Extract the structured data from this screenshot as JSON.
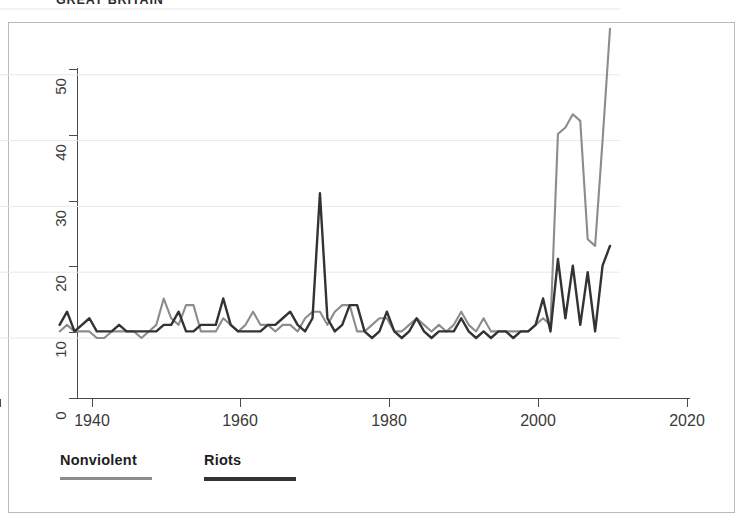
{
  "title": "GREAT BRITAIN",
  "legend": {
    "items": [
      {
        "label": "Nonviolent",
        "color": "#8c8c8c",
        "name": "legend-nonviolent"
      },
      {
        "label": "Riots",
        "color": "#333333",
        "name": "legend-riots"
      }
    ]
  },
  "axes": {
    "y_ticks": [
      "0",
      "10",
      "20",
      "30",
      "40",
      "50"
    ],
    "x_ticks": [
      "1940",
      "1960",
      "1980",
      "2000",
      "2020"
    ]
  },
  "chart_data": {
    "type": "line",
    "title": "GREAT BRITAIN",
    "xlabel": "",
    "ylabel": "",
    "xlim": [
      1940,
      2022
    ],
    "ylim": [
      0,
      52
    ],
    "grid": true,
    "grid_axis": "y",
    "legend_position": "below-axes",
    "x": [
      1946,
      1947,
      1948,
      1949,
      1950,
      1951,
      1952,
      1953,
      1954,
      1955,
      1956,
      1957,
      1958,
      1959,
      1960,
      1961,
      1962,
      1963,
      1964,
      1965,
      1966,
      1967,
      1968,
      1969,
      1970,
      1971,
      1972,
      1973,
      1974,
      1975,
      1976,
      1977,
      1978,
      1979,
      1980,
      1981,
      1982,
      1983,
      1984,
      1985,
      1986,
      1987,
      1988,
      1989,
      1990,
      1991,
      1992,
      1993,
      1994,
      1995,
      1996,
      1997,
      1998,
      1999,
      2000,
      2001,
      2002,
      2003,
      2004,
      2005,
      2006,
      2007,
      2008,
      2009,
      2010,
      2011,
      2012,
      2013,
      2014,
      2015,
      2016,
      2017,
      2018,
      2019,
      2020
    ],
    "series": [
      {
        "name": "Nonviolent",
        "color": "#8c8c8c",
        "values": [
          1,
          2,
          1,
          1,
          1,
          0,
          0,
          1,
          1,
          1,
          1,
          0,
          1,
          2,
          6,
          3,
          2,
          5,
          5,
          1,
          1,
          1,
          3,
          2,
          1,
          2,
          4,
          2,
          2,
          1,
          2,
          2,
          1,
          3,
          4,
          4,
          2,
          4,
          5,
          5,
          1,
          1,
          2,
          3,
          3,
          1,
          1,
          2,
          3,
          2,
          1,
          2,
          1,
          2,
          4,
          2,
          1,
          3,
          1,
          1,
          1,
          1,
          1,
          1,
          2,
          3,
          2,
          31,
          32,
          34,
          33,
          15,
          14,
          30,
          47
        ]
      },
      {
        "name": "Riots",
        "color": "#333333",
        "values": [
          2,
          4,
          1,
          2,
          3,
          1,
          1,
          1,
          2,
          1,
          1,
          1,
          1,
          1,
          2,
          2,
          4,
          1,
          1,
          2,
          2,
          2,
          6,
          2,
          1,
          1,
          1,
          1,
          2,
          2,
          3,
          4,
          2,
          1,
          3,
          22,
          3,
          1,
          2,
          5,
          5,
          1,
          0,
          1,
          4,
          1,
          0,
          1,
          3,
          1,
          0,
          1,
          1,
          1,
          3,
          1,
          0,
          1,
          0,
          1,
          1,
          0,
          1,
          1,
          2,
          6,
          1,
          12,
          3,
          11,
          2,
          10,
          1,
          11,
          14
        ]
      }
    ]
  }
}
